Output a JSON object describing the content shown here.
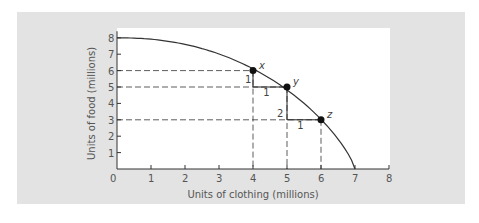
{
  "chart_data": {
    "type": "line",
    "title": "",
    "xlabel": "Units of clothing (millions)",
    "ylabel": "Units of food (millions)",
    "xlim": [
      0,
      8
    ],
    "ylim": [
      0,
      8
    ],
    "x_ticks": [
      "0",
      "1",
      "2",
      "3",
      "4",
      "5",
      "6",
      "7",
      "8"
    ],
    "y_ticks": [
      "1",
      "2",
      "3",
      "4",
      "5",
      "6",
      "7",
      "8"
    ],
    "grid": false,
    "series": [
      {
        "name": "Production possibilities frontier",
        "x": [
          0,
          1,
          2,
          3,
          4,
          5,
          6,
          7
        ],
        "y": [
          8,
          7.8,
          7.4,
          6.8,
          6,
          5,
          3,
          0
        ]
      }
    ],
    "points": [
      {
        "label": "x",
        "x": 4,
        "y": 6
      },
      {
        "label": "y",
        "x": 5,
        "y": 5
      },
      {
        "label": "z",
        "x": 6,
        "y": 3
      }
    ],
    "annotations": [
      {
        "text": "1",
        "meaning": "food given up from x to y"
      },
      {
        "text": "1",
        "meaning": "clothing gained from x to y"
      },
      {
        "text": "2",
        "meaning": "food given up from y to z"
      },
      {
        "text": "1",
        "meaning": "clothing gained from y to z"
      }
    ],
    "legend": null
  }
}
